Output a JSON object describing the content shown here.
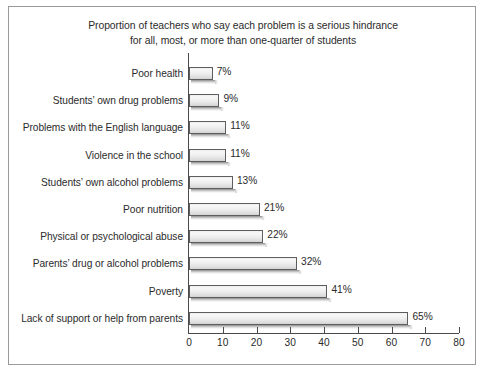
{
  "chart_data": {
    "type": "bar",
    "orientation": "horizontal",
    "title": "Proportion of teachers who say each problem is a serious hindrance for all, most, or more than one-quarter of students",
    "title_line1": "Proportion of teachers who say each problem is a serious hindrance",
    "title_line2": "for all, most, or more than one-quarter of students",
    "xlabel": "",
    "ylabel": "",
    "xlim": [
      0,
      80
    ],
    "grid": false,
    "legend": false,
    "x_ticks": [
      0,
      10,
      20,
      30,
      40,
      50,
      60,
      70,
      80
    ],
    "x_tick_labels": [
      "0",
      "10",
      "20",
      "30",
      "40",
      "50",
      "60",
      "70",
      "80"
    ],
    "categories": [
      "Poor health",
      "Students’ own drug problems",
      "Problems with the English language",
      "Violence in the school",
      "Students’ own alcohol problems",
      "Poor nutrition",
      "Physical or psychological abuse",
      "Parents’ drug or alcohol problems",
      "Poverty",
      "Lack of support or help from parents"
    ],
    "values": [
      7,
      9,
      11,
      11,
      13,
      21,
      22,
      32,
      41,
      65
    ],
    "value_labels": [
      "7%",
      "9%",
      "11%",
      "11%",
      "13%",
      "21%",
      "22%",
      "32%",
      "41%",
      "65%"
    ]
  },
  "style": {
    "bar_fill": "#efefef",
    "bar_border": "#5d5d5d",
    "axis_color": "#4a4a4a",
    "text_color": "#2b2b2b",
    "frame_border": "#9a9a9a",
    "background": "#ffffff"
  }
}
